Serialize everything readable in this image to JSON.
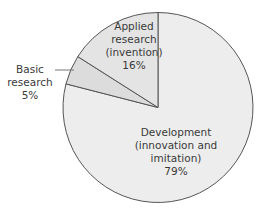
{
  "chart_data": {
    "type": "pie",
    "title": "",
    "start_angle_deg": 0,
    "direction": "clockwise",
    "slices": [
      {
        "name": "Development (innovation and imitation)",
        "value": 79,
        "label_lines": [
          "Development",
          "(innovation and",
          "imitation)",
          "79%"
        ],
        "color": "#ededed"
      },
      {
        "name": "Basic research",
        "value": 5,
        "label_lines": [
          "Basic",
          "research",
          "5%"
        ],
        "color": "#dcdcdc"
      },
      {
        "name": "Applied research (invention)",
        "value": 16,
        "label_lines": [
          "Applied",
          "research",
          "(invention)",
          "16%"
        ],
        "color": "#e4e4e4"
      }
    ],
    "legend": null,
    "stroke_color": "#555555"
  }
}
